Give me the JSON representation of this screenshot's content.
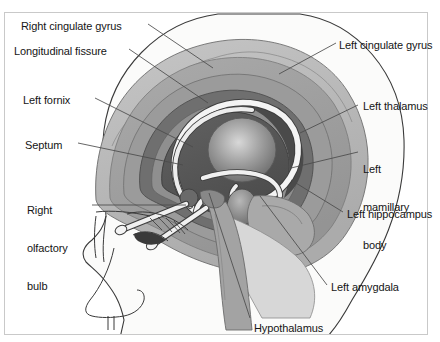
{
  "figure": {
    "top_partial_text": "",
    "border_color": "#c9c9c9",
    "background_color": "#ffffff",
    "text_color": "#151515",
    "leader_line_color": "#4a4a4a"
  },
  "palette": {
    "skin": "#fbfbfa",
    "outline": "#3a3a3a",
    "cortex_outer": "#b9b9b9",
    "cortex_mid": "#a0a0a0",
    "cortex_inner": "#8d8d8d",
    "cingulate_band": "#6f6f6f",
    "corpus_dark": "#575757",
    "deep_dark": "#4a4a4a",
    "thalamus": "#8a8a8a",
    "thalamus_light": "#c4c4c4",
    "amygdala": "#7b7b7b",
    "mamillary": "#6a6a6a",
    "fornix_white": "#f4f4f4",
    "brainstem": "#9a9a9a",
    "hippocampus": "#cfcfcf",
    "temporal": "#d5d5d5"
  },
  "labels": [
    {
      "id": "right-cingulate-gyrus",
      "text": "Right cingulate gyrus",
      "x": 21,
      "y": 20,
      "align": "left",
      "lines": [
        "Right cingulate gyrus"
      ]
    },
    {
      "id": "longitudinal-fissure",
      "text": "Longitudinal fissure",
      "x": 14,
      "y": 45,
      "align": "left",
      "lines": [
        "Longitudinal fissure"
      ]
    },
    {
      "id": "left-fornix",
      "text": "Left fornix",
      "x": 23,
      "y": 94,
      "align": "left",
      "lines": [
        "Left fornix"
      ]
    },
    {
      "id": "septum",
      "text": "Septum",
      "x": 25,
      "y": 139,
      "align": "left",
      "lines": [
        "Septum"
      ]
    },
    {
      "id": "right-olfactory-bulb",
      "text": "Right olfactory bulb",
      "x": 27,
      "y": 179,
      "align": "left",
      "lines": [
        "Right",
        "olfactory",
        "bulb"
      ]
    },
    {
      "id": "left-cingulate-gyrus",
      "text": "Left cingulate gyrus",
      "x": 339,
      "y": 39,
      "align": "left",
      "lines": [
        "Left cingulate gyrus"
      ]
    },
    {
      "id": "left-thalamus",
      "text": "Left thalamus",
      "x": 363,
      "y": 100,
      "align": "left",
      "lines": [
        "Left thalamus"
      ]
    },
    {
      "id": "left-mamillary-body",
      "text": "Left mamillary body",
      "x": 363,
      "y": 138,
      "align": "left",
      "lines": [
        "Left",
        "mamillary",
        "body"
      ]
    },
    {
      "id": "left-hippocampus",
      "text": "Left hippocampus",
      "x": 347,
      "y": 208,
      "align": "left",
      "lines": [
        "Left hippocampus"
      ]
    },
    {
      "id": "left-amygdala",
      "text": "Left amygdala",
      "x": 331,
      "y": 281,
      "align": "left",
      "lines": [
        "Left amygdala"
      ]
    },
    {
      "id": "hypothalamus",
      "text": "Hypothalamus",
      "x": 254,
      "y": 322,
      "align": "left",
      "lines": [
        "Hypothalamus"
      ]
    }
  ],
  "leaders": [
    {
      "id": "leader-right-cingulate-gyrus",
      "from": [
        148,
        24
      ],
      "to": [
        213,
        68
      ]
    },
    {
      "id": "leader-longitudinal-fissure",
      "from": [
        129,
        49
      ],
      "to": [
        208,
        103
      ]
    },
    {
      "id": "leader-left-fornix",
      "from": [
        95,
        98
      ],
      "to": [
        193,
        147
      ]
    },
    {
      "id": "leader-septum",
      "from": [
        78,
        143
      ],
      "to": [
        183,
        165
      ]
    },
    {
      "id": "leader-right-olfactory-bulb",
      "from": [
        92,
        205
      ],
      "to": [
        186,
        205
      ]
    },
    {
      "id": "leader-left-cingulate-gyrus",
      "from": [
        336,
        43
      ],
      "to": [
        279,
        74
      ]
    },
    {
      "id": "leader-left-thalamus",
      "from": [
        358,
        105
      ],
      "to": [
        300,
        133
      ]
    },
    {
      "id": "leader-left-mamillary-body",
      "from": [
        358,
        152
      ],
      "to": [
        291,
        168
      ]
    },
    {
      "id": "leader-left-hippocampus",
      "from": [
        343,
        212
      ],
      "to": [
        291,
        180
      ]
    },
    {
      "id": "leader-left-amygdala",
      "from": [
        327,
        285
      ],
      "to": [
        260,
        196
      ]
    },
    {
      "id": "leader-hypothalamus",
      "from": [
        250,
        318
      ],
      "to": [
        209,
        193
      ]
    }
  ]
}
